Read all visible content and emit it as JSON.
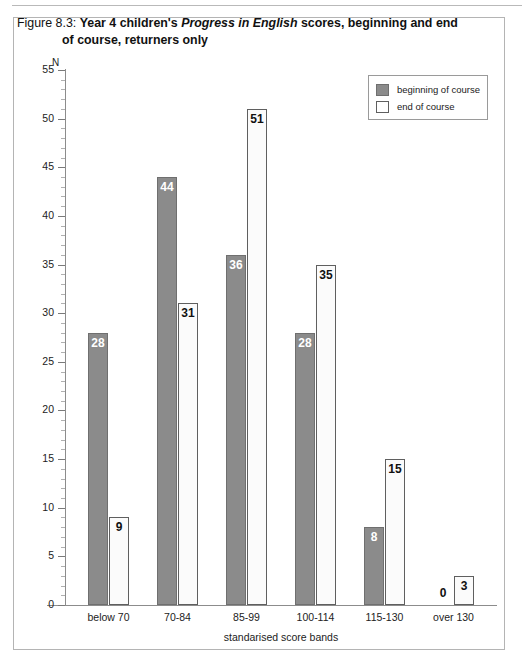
{
  "figure": {
    "caption_number": "Figure 8.3:",
    "caption_part1": "Year 4 children's ",
    "caption_emphasis": "Progress in English",
    "caption_part2": " scores, beginning and end",
    "caption_line2": "of course, returners only"
  },
  "legend": {
    "items": [
      {
        "label": "beginning of course",
        "swatch": "filled-gray-swatch",
        "color": "#8b8b8b"
      },
      {
        "label": "end of course",
        "swatch": "empty-white-swatch",
        "color": "#ffffff"
      }
    ]
  },
  "axes": {
    "y_name": "N",
    "x_title": "standarised score bands",
    "y_ticks": [
      "0",
      "5",
      "10",
      "15",
      "20",
      "25",
      "30",
      "35",
      "40",
      "45",
      "50",
      "55"
    ]
  },
  "chart_data": {
    "type": "bar",
    "title": "Figure 8.3: Year 4 children's Progress in English scores, beginning and end of course, returners only",
    "xlabel": "standarised score bands",
    "ylabel": "N",
    "ylim": [
      0,
      55
    ],
    "y_tick_step": 5,
    "y_minor_tick_step": 1,
    "grid": false,
    "legend_position": "top-right",
    "categories": [
      "below 70",
      "70-84",
      "85-99",
      "100-114",
      "115-130",
      "over 130"
    ],
    "series": [
      {
        "name": "beginning of course",
        "color": "#8b8b8b",
        "values": [
          28,
          44,
          36,
          28,
          8,
          0
        ]
      },
      {
        "name": "end of course",
        "color": "#ffffff",
        "values": [
          9,
          31,
          51,
          35,
          15,
          3
        ]
      }
    ]
  }
}
